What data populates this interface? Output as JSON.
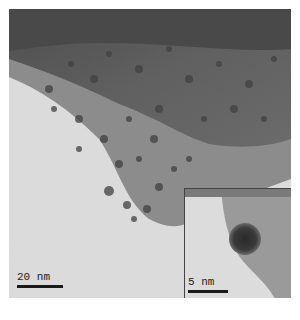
{
  "figure": {
    "type": "TEM micrograph",
    "main_scalebar": {
      "label": "20 nm",
      "length_px": 46
    },
    "inset": {
      "scalebar": {
        "label": "5 nm",
        "length_px": 40
      },
      "description": "single dark nanoparticle, high magnification"
    },
    "colors": {
      "dark_region": "#5a5a5a",
      "mid_region": "#8a8a8a",
      "light_region": "#e6e6e6",
      "particle": "#3a3a3a"
    }
  }
}
